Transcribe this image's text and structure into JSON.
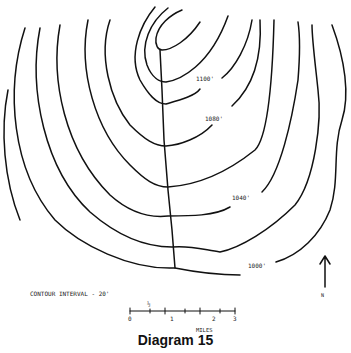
{
  "diagram": {
    "title": "Diagram 15",
    "type": "topographic contour map",
    "contour_interval_label": "CONTOUR INTERVAL - 20'",
    "contour_labels": [
      {
        "text": "1100'",
        "x": 196,
        "y": 81
      },
      {
        "text": "1080'",
        "x": 205,
        "y": 121
      },
      {
        "text": "1040'",
        "x": 232,
        "y": 200
      },
      {
        "text": "1000'",
        "x": 248,
        "y": 268
      }
    ],
    "scale_bar": {
      "label": "MILES",
      "ticks": [
        "0",
        "1",
        "2",
        "3"
      ],
      "half_mark": "½"
    },
    "north_arrow": {
      "label": "N"
    },
    "stroke_color": "#111111",
    "background_color": "#ffffff"
  }
}
